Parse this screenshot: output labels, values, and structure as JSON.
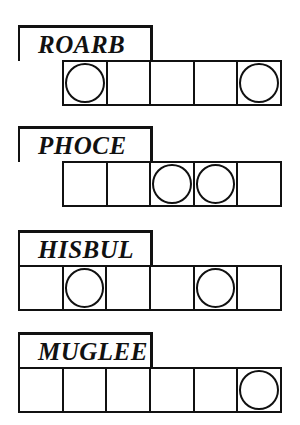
{
  "puzzles": [
    {
      "word": "ROARB",
      "top": 25,
      "box_count": 5,
      "row_left": 62,
      "circled": [
        0,
        4
      ]
    },
    {
      "word": "PHOCE",
      "top": 126,
      "box_count": 5,
      "row_left": 62,
      "circled": [
        2,
        3
      ]
    },
    {
      "word": "HISBUL",
      "top": 230,
      "box_count": 6,
      "row_left": 18,
      "circled": [
        1,
        4
      ]
    },
    {
      "word": "MUGLEE",
      "top": 332,
      "box_count": 6,
      "row_left": 18,
      "circled": [
        5
      ]
    }
  ],
  "colors": {
    "ink": "#111111",
    "paper": "#ffffff"
  }
}
